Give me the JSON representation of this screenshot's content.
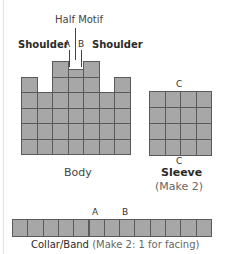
{
  "diagram": {
    "cell_size_px": 15.5,
    "colors": {
      "cell_fill": "#a7a7a7",
      "grid_line": "#5a5a5a",
      "label_text": "#333333"
    },
    "body": {
      "label": "Body",
      "half_motif_label": "Half Motif",
      "shoulder_left_label": "Shoulder",
      "shoulder_right_label": "Shoulder",
      "marker_a": "A",
      "marker_b": "B",
      "columns": 7,
      "main_rows": 4,
      "column_heights_in_cells": [
        5,
        4,
        6,
        5.5,
        6,
        4,
        5
      ]
    },
    "sleeve": {
      "label": "Sleeve",
      "note": "(Make 2)",
      "marker_top": "C",
      "marker_bottom": "C",
      "columns": 4,
      "rows": 4
    },
    "collar": {
      "label": "Collar/Band",
      "note": "(Make 2: 1 for facing)",
      "marker_a": "A",
      "marker_b": "B",
      "cells": 13
    }
  }
}
